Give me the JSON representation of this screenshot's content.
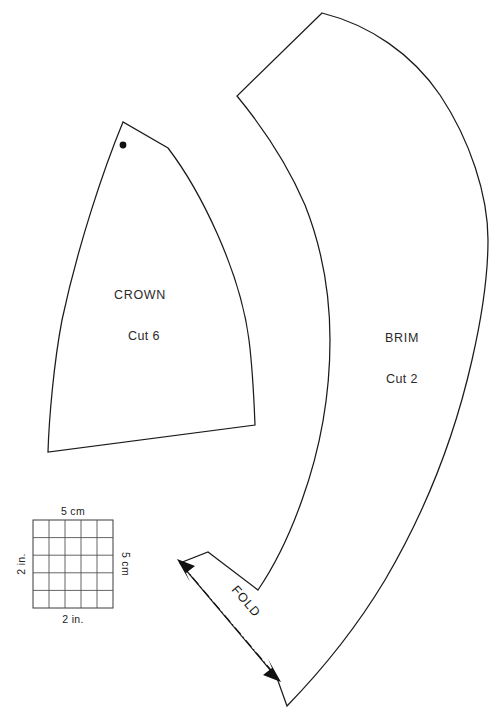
{
  "sheet": {
    "title": "Hat Sewing Pattern Sheet",
    "background_color": "#ffffff",
    "line_color": "#1b1b1b",
    "width": 498,
    "height": 717
  },
  "pieces": [
    {
      "id": "crown",
      "name": "CROWN",
      "cut_instruction": "Cut 6",
      "marking": "grain-dot"
    },
    {
      "id": "brim",
      "name": "BRIM",
      "cut_instruction": "Cut 2",
      "marking": "fold-arrow-line"
    }
  ],
  "crown": {
    "label": "CROWN",
    "cut_label": "Cut 6",
    "label_x": 140,
    "label_y": 299,
    "cut_label_x": 144,
    "cut_label_y": 340,
    "dot_x": 123,
    "dot_y": 145,
    "dot_r": 3.4
  },
  "brim": {
    "label": "BRIM",
    "cut_label": "Cut 2",
    "label_x": 402,
    "label_y": 342,
    "cut_label_x": 402,
    "cut_label_y": 383
  },
  "fold": {
    "label": "FOLD",
    "label_x": 243,
    "label_y": 604,
    "label_rotation": 49,
    "line_start_x": 182,
    "line_start_y": 565,
    "line_end_x": 276,
    "line_end_y": 676,
    "arrow_top_name": "arrow-up-left",
    "arrow_bottom_name": "arrow-down-right"
  },
  "scale_grid": {
    "x": 33,
    "y": 520,
    "width": 80,
    "height": 88,
    "divisions": 5,
    "labels": {
      "top": "5 cm",
      "right": "5 cm",
      "bottom": "2 in.",
      "left": "2 in."
    },
    "label_positions": {
      "top_x": 73,
      "top_y": 515,
      "bottom_x": 73,
      "bottom_y": 623,
      "left_x": 25,
      "left_y": 564,
      "right_x": 122,
      "right_y": 564
    }
  }
}
